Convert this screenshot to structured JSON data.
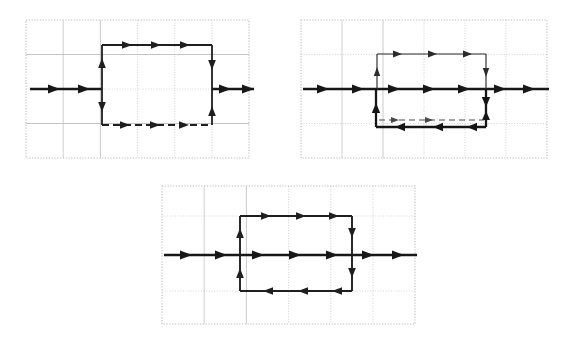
{
  "figure": {
    "kind": "field-line-diagrams",
    "canvas": {
      "width": 575,
      "height": 337,
      "background": "#ffffff"
    },
    "colors": {
      "paper": "#ffffff",
      "dotted_border": "#b9b9b9",
      "grid_minor": "#c9c9c9",
      "grid_major": "#9a9a9a",
      "ink_heavy": "#1a1a1a",
      "ink_light": "#3a3a3a"
    },
    "stroke_widths": {
      "grid": 0.8,
      "border_dots": 1.0,
      "ink_heavy": 2.6,
      "ink_medium": 1.7,
      "ink_light": 1.1
    }
  },
  "panels": [
    {
      "id": "panel-1",
      "label": "panel-top-left",
      "frame": {
        "x": 26,
        "y": 20,
        "width": 223,
        "height": 138
      },
      "grid": {
        "cols": 6,
        "rows": 4,
        "cell_w": 37.2,
        "cell_h": 34.5
      },
      "axis_line": {
        "name": "horizontal-axis-left-inflow",
        "y": 89,
        "segments": [
          {
            "x1": 26,
            "x2": 102,
            "weight": "heavy",
            "arrows": 2,
            "direction": "right"
          },
          {
            "x1": 212,
            "x2": 249,
            "weight": "heavy",
            "arrows": 2,
            "direction": "right"
          }
        ]
      },
      "rectangle": {
        "name": "field-loop-rect",
        "left": 102,
        "right": 212,
        "top": 45,
        "bottom": 125,
        "top_edge": {
          "style": "solid",
          "weight": "medium",
          "direction": "right",
          "arrows": 3
        },
        "bottom_edge": {
          "style": "dashed",
          "weight": "medium",
          "direction": "right",
          "arrows": 3
        },
        "left_edge": {
          "style": "solid",
          "weight": "medium",
          "upper_arrow": "up",
          "lower_arrow": "down"
        },
        "right_edge": {
          "style": "solid",
          "weight": "medium",
          "upper_arrow": "down",
          "lower_arrow": "up"
        }
      }
    },
    {
      "id": "panel-2",
      "label": "panel-top-right",
      "frame": {
        "x": 301,
        "y": 20,
        "width": 246,
        "height": 138
      },
      "grid": {
        "cols": 6,
        "rows": 4,
        "cell_w": 41.0,
        "cell_h": 34.5
      },
      "axis_line": {
        "name": "horizontal-axis-through",
        "y": 89,
        "segments": [
          {
            "x1": 301,
            "x2": 547,
            "weight": "heavy",
            "arrows": 6,
            "direction": "right"
          }
        ]
      },
      "upper_rect": {
        "name": "upper-field-loop-rect",
        "left": 377,
        "right": 486,
        "top": 54,
        "bottom": 89,
        "weight": "light",
        "top_edge": {
          "direction": "right",
          "arrows": 3
        },
        "left_edge": {
          "direction": "up",
          "arrows": 1
        },
        "right_edge": {
          "direction": "down",
          "arrows": 1
        }
      },
      "lower_rect": {
        "name": "lower-field-loop-rect",
        "left": 377,
        "right": 486,
        "top": 89,
        "bottom": 127,
        "weight": "heavy",
        "top_edge": {
          "direction": "right",
          "arrows": 3
        },
        "bottom_edge": {
          "direction": "left",
          "arrows": 3
        },
        "left_edge": {
          "direction": "up",
          "arrows": 1
        },
        "right_edge": {
          "direction": "down",
          "arrows": 1
        }
      },
      "inner_dashed": {
        "name": "inner-dashed-return",
        "y": 120,
        "x1": 380,
        "x2": 484,
        "style": "dashed",
        "weight": "light",
        "direction": "right",
        "arrows": 2
      }
    },
    {
      "id": "panel-3",
      "label": "panel-bottom-center",
      "frame": {
        "x": 162,
        "y": 186,
        "width": 253,
        "height": 138
      },
      "grid": {
        "cols": 6,
        "rows": 4,
        "cell_w": 42.2,
        "cell_h": 34.5
      },
      "axis_line": {
        "name": "horizontal-axis-through",
        "y": 255,
        "segments": [
          {
            "x1": 162,
            "x2": 415,
            "weight": "heavy",
            "arrows": 6,
            "direction": "right"
          }
        ]
      },
      "rectangle": {
        "name": "field-loop-rect",
        "left": 240,
        "right": 352,
        "top": 216,
        "bottom": 291,
        "weight": "medium",
        "top_edge": {
          "direction": "right",
          "arrows": 3
        },
        "bottom_edge": {
          "direction": "left",
          "arrows": 3
        },
        "left_edge": {
          "upper_arrow": "up",
          "lower_arrow": "up"
        },
        "right_edge": {
          "upper_arrow": "down",
          "lower_arrow": "down"
        }
      }
    }
  ]
}
